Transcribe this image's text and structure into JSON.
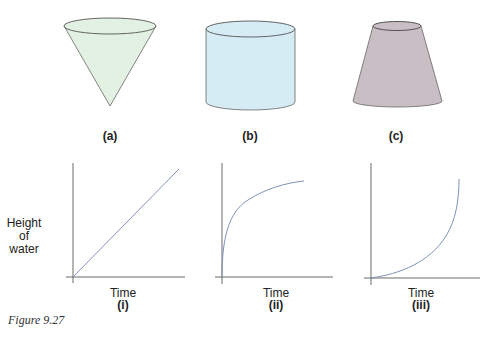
{
  "figure": {
    "caption": "Figure 9.27",
    "colors": {
      "cone_fill": "#e3f1e2",
      "cylinder_fill": "#d6ecf5",
      "frustum_fill": "#c9bec3",
      "outline": "#555555",
      "curve": "#7f93b8",
      "axis": "#444444"
    },
    "containers": [
      {
        "id": "a",
        "label": "(a)",
        "shape": "inverted cone"
      },
      {
        "id": "b",
        "label": "(b)",
        "shape": "cylinder"
      },
      {
        "id": "c",
        "label": "(c)",
        "shape": "frustum (narrow top)"
      }
    ],
    "graphs": {
      "ylabel_line1": "Height",
      "ylabel_line2": "of",
      "ylabel_line3": "water",
      "items": [
        {
          "id": "i",
          "label": "(i)",
          "xlabel": "Time",
          "curve": "linear"
        },
        {
          "id": "ii",
          "label": "(ii)",
          "xlabel": "Time",
          "curve": "concave (decelerating)"
        },
        {
          "id": "iii",
          "label": "(iii)",
          "xlabel": "Time",
          "curve": "convex (accelerating)"
        }
      ]
    }
  }
}
